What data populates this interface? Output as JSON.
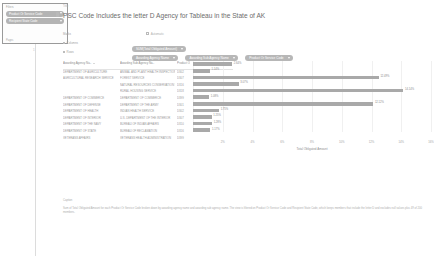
{
  "filter_panel": {
    "caption_label": "Filters",
    "footer_label": "Pages",
    "pills": [
      {
        "label": "Product Or Service Code",
        "icon": "chevron-down-icon"
      },
      {
        "label": "Recipient State Code",
        "icon": "chevron-down-icon"
      }
    ],
    "stem_tick": "1"
  },
  "worksheet": {
    "title_label": "Title",
    "title": "PSC Code Includes the letter D Agency for Tableau in the State of AK",
    "title_icon": "worksheet-icon",
    "shelves": {
      "marks_label": "Marks",
      "marks_value": "Automatic",
      "marks_icon": "bar-mark-icon",
      "columns_label": "Columns",
      "columns_pills": [
        {
          "label": "SUM(Total Obligated Amount)",
          "icon": "chevron-down-icon"
        }
      ],
      "rows_label": "Rows",
      "rows_pills": [
        {
          "label": "Awarding Agency Name",
          "icon": "chevron-down-icon"
        },
        {
          "label": "Awarding Sub Agency Name",
          "icon": "chevron-down-icon"
        },
        {
          "label": "Product Or Service Code",
          "icon": "chevron-down-icon"
        }
      ]
    }
  },
  "chart_data": {
    "type": "bar",
    "orientation": "horizontal",
    "title": "PSC Code Includes the letter D Agency for Tableau in the State of AK",
    "xlabel": "Total Obligated Amount",
    "ylabel": "",
    "grid": true,
    "legend": "none",
    "xlim": [
      0,
      16
    ],
    "xticks": [
      "0%",
      "2%",
      "4%",
      "6%",
      "8%",
      "10%",
      "12%",
      "14%",
      "16%"
    ],
    "columns": [
      "Awarding Agency Na..",
      "Awarding Sub Agency Na..",
      "Product Or.."
    ],
    "rows": [
      {
        "agency": "DEPARTMENT OF AGRICULTURE",
        "sub_agency": "ANIMAL AND PLANT HEALTH INSPECTION SERVICE",
        "psc": "D302",
        "value": 2.64,
        "label": "2.64%"
      },
      {
        "agency": "AGRICULTURAL RESEARCH SERVICE",
        "sub_agency": "FOREST SERVICE",
        "psc": "D307",
        "value": 1.14,
        "label": "1.14%"
      },
      {
        "agency": "",
        "sub_agency": "NATURAL RESOURCES CONSERVATION SERVICE",
        "psc": "D316",
        "value": 12.49,
        "label": "12.49%"
      },
      {
        "agency": "",
        "sub_agency": "RURAL HOUSING SERVICE",
        "psc": "D318",
        "value": 3.07,
        "label": "3.07%"
      },
      {
        "agency": "DEPARTMENT OF COMMERCE",
        "sub_agency": "DEPARTMENT OF COMMERCE",
        "psc": "D399",
        "value": 14.14,
        "label": "14.14%"
      },
      {
        "agency": "DEPARTMENT OF DEFENSE",
        "sub_agency": "DEPARTMENT OF THE ARMY",
        "psc": "D301",
        "value": 1.08,
        "label": "1.08%"
      },
      {
        "agency": "DEPARTMENT OF HEALTH",
        "sub_agency": "INDIAN HEALTH SERVICE",
        "psc": "D302",
        "value": 12.12,
        "label": "12.12%"
      },
      {
        "agency": "DEPARTMENT OF INTERIOR",
        "sub_agency": "U.S. DEPARTMENT OF THE INTERIOR",
        "psc": "D307",
        "value": 1.75,
        "label": "1.75%"
      },
      {
        "agency": "DEPARTMENT OF THE NAVY",
        "sub_agency": "BUREAU OF INDIAN AFFAIRS",
        "psc": "D310",
        "value": 1.25,
        "label": "1.25%"
      },
      {
        "agency": "DEPARTMENT OF STATE",
        "sub_agency": "BUREAU OF RECLAMATION",
        "psc": "D316",
        "value": 1.28,
        "label": "1.28%"
      },
      {
        "agency": "VETERANS AFFAIRS",
        "sub_agency": "VETERANS HEALTH ADMINISTRATION",
        "psc": "D399",
        "value": 1.17,
        "label": "1.17%"
      }
    ]
  },
  "caption": {
    "label": "Caption",
    "text": "Sum of Total Obligated Amount for each Product Or Service Code broken down by awarding agency name and awarding sub agency name. The view is filtered on Product Or Service Code and Recipient State Code, which keeps members that include the letter D and excludes null values plus 49 of 200 members."
  }
}
